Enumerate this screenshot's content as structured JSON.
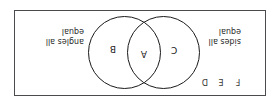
{
  "figure": {
    "type": "venn-diagram",
    "orientation": "rotated-180",
    "universal_box": {
      "border_color": "#4a4a4f",
      "fill": "#ffffff"
    },
    "circle_color": "#1a1a1a"
  },
  "circles": {
    "left": {
      "name": "sides-all-equal-circle"
    },
    "right": {
      "name": "angles-all-equal-circle"
    }
  },
  "regions": {
    "left_only": "C",
    "intersection": "A",
    "right_only": "B"
  },
  "outside_labels": [
    {
      "key": "d",
      "label": "D"
    },
    {
      "key": "e",
      "label": "E"
    },
    {
      "key": "f",
      "label": "F"
    }
  ],
  "captions": {
    "left": {
      "line1": "sides all",
      "line2": "equal",
      "full": "sides all equal"
    },
    "right": {
      "line1": "angles all",
      "line2": "equal",
      "full": "angles all equal"
    }
  }
}
